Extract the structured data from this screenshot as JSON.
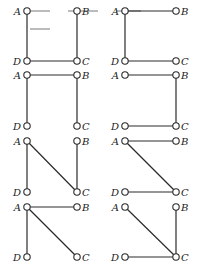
{
  "figure": {
    "node_labels": {
      "A": "A",
      "B": "B",
      "C": "C",
      "D": "D"
    },
    "colors": {
      "edge": "#2a2a2a",
      "node_fill": "#ffffff",
      "label": "#222222"
    },
    "layout": {
      "columns_x": [
        {
          "left": 27,
          "right": 77
        },
        {
          "left": 125,
          "right": 176
        }
      ],
      "rows_y": [
        {
          "top": 11,
          "bottom": 61
        },
        {
          "top": 75,
          "bottom": 126
        },
        {
          "top": 141,
          "bottom": 192
        },
        {
          "top": 207,
          "bottom": 257
        }
      ]
    },
    "panels": [
      {
        "row": 0,
        "col": 0,
        "edges": [
          [
            "A",
            "D"
          ],
          [
            "B",
            "C"
          ],
          [
            "D",
            "C"
          ]
        ]
      },
      {
        "row": 0,
        "col": 1,
        "edges": [
          [
            "A",
            "B"
          ],
          [
            "A",
            "D"
          ],
          [
            "D",
            "C"
          ]
        ]
      },
      {
        "row": 1,
        "col": 0,
        "edges": [
          [
            "A",
            "B"
          ],
          [
            "A",
            "D"
          ],
          [
            "B",
            "C"
          ]
        ]
      },
      {
        "row": 1,
        "col": 1,
        "edges": [
          [
            "A",
            "B"
          ],
          [
            "B",
            "C"
          ],
          [
            "D",
            "C"
          ]
        ]
      },
      {
        "row": 2,
        "col": 0,
        "edges": [
          [
            "A",
            "D"
          ],
          [
            "A",
            "C"
          ],
          [
            "B",
            "C"
          ]
        ]
      },
      {
        "row": 2,
        "col": 1,
        "edges": [
          [
            "A",
            "B"
          ],
          [
            "A",
            "C"
          ],
          [
            "D",
            "C"
          ]
        ]
      },
      {
        "row": 3,
        "col": 0,
        "edges": [
          [
            "A",
            "B"
          ],
          [
            "A",
            "D"
          ],
          [
            "A",
            "C"
          ]
        ]
      },
      {
        "row": 3,
        "col": 1,
        "edges": [
          [
            "A",
            "C"
          ],
          [
            "B",
            "C"
          ],
          [
            "D",
            "C"
          ]
        ]
      }
    ]
  }
}
